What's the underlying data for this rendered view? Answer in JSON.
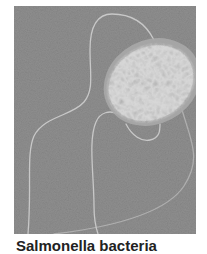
{
  "figure": {
    "background_color": "#8f8f8f",
    "cell_color": "#d6d6d6",
    "cell_edge_color": "#bcbcbc",
    "flagellum_color": "#c4c4c4"
  },
  "caption": {
    "text": "Salmonella bacteria"
  }
}
